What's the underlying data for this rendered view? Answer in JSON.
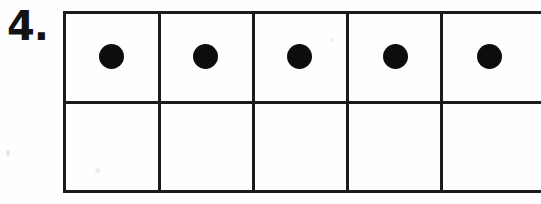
{
  "worksheet": {
    "problem_number_label": "4.",
    "ink_color": "#1b1b1b",
    "dot_color": "#0d0d0d",
    "page_background": "#fefefe"
  },
  "ten_frame": {
    "rows": 2,
    "columns": 5,
    "total_cells": 10,
    "filled_count": 5,
    "empty_count": 5,
    "truncated_at_right_edge": true,
    "top_row": [
      {
        "index": 1,
        "filled": true,
        "counter": "dot"
      },
      {
        "index": 2,
        "filled": true,
        "counter": "dot"
      },
      {
        "index": 3,
        "filled": true,
        "counter": "dot"
      },
      {
        "index": 4,
        "filled": true,
        "counter": "dot"
      },
      {
        "index": 5,
        "filled": true,
        "counter": "dot"
      }
    ],
    "bottom_row": [
      {
        "index": 6,
        "filled": false,
        "counter": ""
      },
      {
        "index": 7,
        "filled": false,
        "counter": ""
      },
      {
        "index": 8,
        "filled": false,
        "counter": ""
      },
      {
        "index": 9,
        "filled": false,
        "counter": ""
      },
      {
        "index": 10,
        "filled": false,
        "counter": ""
      }
    ]
  }
}
